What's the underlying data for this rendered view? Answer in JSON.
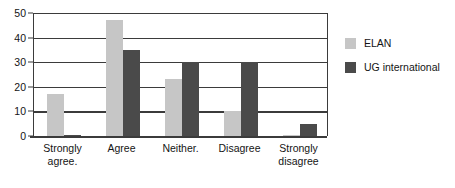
{
  "chart_data": {
    "type": "bar",
    "title": "",
    "subtitle": "",
    "xlabel": "",
    "ylabel": "",
    "ylim": [
      0,
      50
    ],
    "yticks": [
      0,
      10,
      20,
      30,
      40,
      50
    ],
    "ytick_labels": [
      "0",
      "10",
      "20",
      "30",
      "40",
      "50"
    ],
    "grid": true,
    "grid_axis": "y",
    "legend_position": "right",
    "categories": [
      "Strongly agree.",
      "Agree",
      "Neither.",
      "Disagree",
      "Strongly disagree"
    ],
    "category_lines": [
      [
        "Strongly",
        "agree."
      ],
      [
        "Agree"
      ],
      [
        "Neither."
      ],
      [
        "Disagree"
      ],
      [
        "Strongly",
        "disagree"
      ]
    ],
    "series": [
      {
        "name": "ELAN",
        "color": "#c6c6c6",
        "values": [
          17,
          47,
          23,
          10,
          0.4
        ]
      },
      {
        "name": "UG international",
        "color": "#4a4a4a",
        "values": [
          0.6,
          35,
          30,
          30,
          5
        ]
      }
    ]
  },
  "legend": {
    "entries": [
      {
        "label": "ELAN",
        "color": "#c6c6c6"
      },
      {
        "label": "UG international",
        "color": "#4a4a4a"
      }
    ]
  },
  "axis": {
    "line_color": "#3b3b3b"
  }
}
